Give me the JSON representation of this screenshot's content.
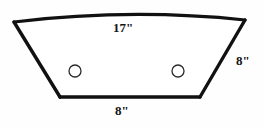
{
  "diagram": {
    "type": "geometry-figure",
    "shape_name": "curved-top-trapezoid",
    "background_color": "#fefefe",
    "outline_color": "#111111",
    "fill_color": "#ffffff",
    "outline_width": 3,
    "labels": {
      "top": "17\"",
      "right": "8\"",
      "bottom": "8\""
    },
    "holes": [
      {
        "name": "left-hole",
        "cx": 75,
        "cy": 71,
        "r": 6
      },
      {
        "name": "right-hole",
        "cx": 178,
        "cy": 71,
        "r": 6
      }
    ],
    "vertices": {
      "top_left": "14,22",
      "top_right": "245,20",
      "bottom_right": "200,97",
      "bottom_left": "60,97"
    },
    "top_edge": {
      "style": "arc",
      "apex_y": 13
    }
  }
}
